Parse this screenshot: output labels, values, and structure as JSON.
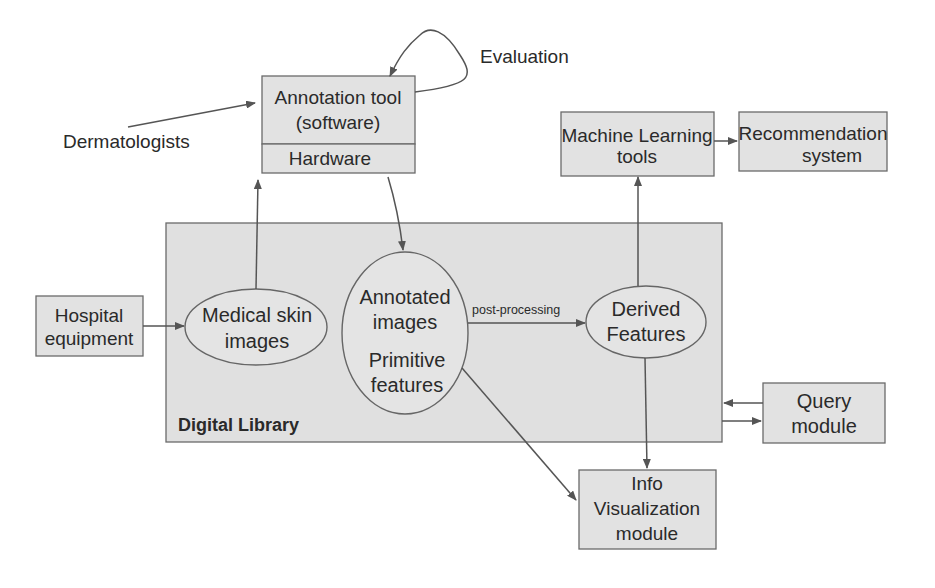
{
  "diagram": {
    "title": "",
    "labels": {
      "dermatologists": "Dermatologists",
      "evaluation": "Evaluation",
      "post_processing": "post-processing",
      "digital_library": "Digital Library"
    },
    "nodes": {
      "annotation_tool": {
        "line1": "Annotation tool",
        "line2": "(software)",
        "shape": "box"
      },
      "hardware": {
        "line1": "Hardware",
        "shape": "box"
      },
      "machine_learning": {
        "line1": "Machine Learning",
        "line2": "tools",
        "shape": "box"
      },
      "recommendation": {
        "line1": "Recommendation",
        "line2": "system",
        "shape": "box"
      },
      "hospital": {
        "line1": "Hospital",
        "line2": "equipment",
        "shape": "box"
      },
      "medical_skin": {
        "line1": "Medical skin",
        "line2": "images",
        "shape": "ellipse"
      },
      "annotated": {
        "line1": "Annotated",
        "line2": "images",
        "line3": "Primitive",
        "line4": "features",
        "shape": "ellipse"
      },
      "derived": {
        "line1": "Derived",
        "line2": "Features",
        "shape": "ellipse"
      },
      "query": {
        "line1": "Query",
        "line2": "module",
        "shape": "box"
      },
      "info_vis": {
        "line1": "Info",
        "line2": "Visualization",
        "line3": "module",
        "shape": "box"
      }
    },
    "edges": [
      {
        "from": "Dermatologists",
        "to": "Annotation tool"
      },
      {
        "from": "Annotation tool",
        "to": "Annotation tool",
        "label": "Evaluation"
      },
      {
        "from": "Medical skin images",
        "to": "Annotation tool"
      },
      {
        "from": "Hardware",
        "to": "Annotated images / Primitive features"
      },
      {
        "from": "Hospital equipment",
        "to": "Medical skin images"
      },
      {
        "from": "Annotated images / Primitive features",
        "to": "Derived Features",
        "label": "post-processing"
      },
      {
        "from": "Derived Features",
        "to": "Machine Learning tools"
      },
      {
        "from": "Machine Learning tools",
        "to": "Recommendation system"
      },
      {
        "from": "Derived Features",
        "to": "Info Visualization module"
      },
      {
        "from": "Annotated images / Primitive features",
        "to": "Info Visualization module"
      },
      {
        "from": "Query module",
        "to": "Digital Library"
      },
      {
        "from": "Digital Library",
        "to": "Query module"
      }
    ]
  }
}
